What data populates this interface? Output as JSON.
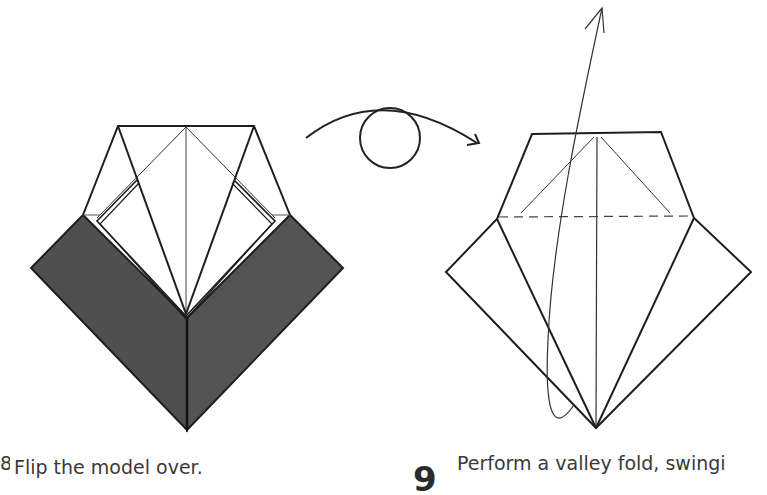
{
  "steps": [
    {
      "number": "8",
      "caption": "Flip the model over.",
      "figure": "folded-model-back-view"
    },
    {
      "number": "9",
      "caption": "Perform a valley fold, swingi",
      "figure": "valley-fold-upward"
    }
  ],
  "symbols": {
    "flip_icon": "turn-over-arrow-icon",
    "fold_arrow": "valley-fold-arrow-icon"
  },
  "colors": {
    "paper_white": "#ffffff",
    "paper_color_side": "#4f4f4f",
    "line": "#1e1e1e",
    "text": "#3a3a3a"
  }
}
